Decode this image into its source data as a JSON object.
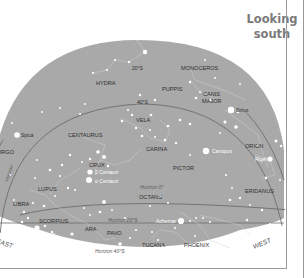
{
  "title": {
    "line1": "Looking",
    "line2": "south"
  },
  "colors": {
    "sky": "#a9a9a9",
    "background": "#ffffff",
    "line": "#6d6d6d",
    "star": "#ffffff",
    "label": "#2f2f2f",
    "horizon_label": "#5a5a5a"
  },
  "markers": {
    "zenith": "Zenith",
    "zenith_deg": "0°",
    "alt_20": "20°S",
    "alt_40": "40°S",
    "horizon": "Horizon 0°",
    "horizon_20": "Horizon 20°S",
    "horizon_40": "Horizon 40°S",
    "horizon_left": "Horizon",
    "east": "EAST",
    "west": "WEST"
  },
  "constellations": {
    "hydra": "HYDRA",
    "monoceros": "MONOCEROS",
    "puppis": "PUPPIS",
    "canis_major_1": "CANIS",
    "canis_major_2": "MAJOR",
    "vela": "VELA",
    "centaurus": "CENTAURUS",
    "carina": "CARINA",
    "crux": "CRUX",
    "pictor": "PICTOR",
    "orion": "ORION",
    "virgo": "VIRGO",
    "lupus": "LUPUS",
    "libra": "LIBRA",
    "octans": "OCTANS",
    "eridanus": "ERIDANUS",
    "scorpius": "SCORPIUS",
    "ara": "ARA",
    "pavo": "PAVO",
    "tucana": "TUCANA",
    "phoenix": "PHOENIX"
  },
  "stars": {
    "spica": "Spica",
    "sirius": "Sirius",
    "canopus": "Canopus",
    "rigel": "Rigel",
    "beta_centauri": "β Centauri",
    "alpha_centauri": "α Centauri",
    "achernar": "Achernar",
    "antares": "Antares"
  }
}
